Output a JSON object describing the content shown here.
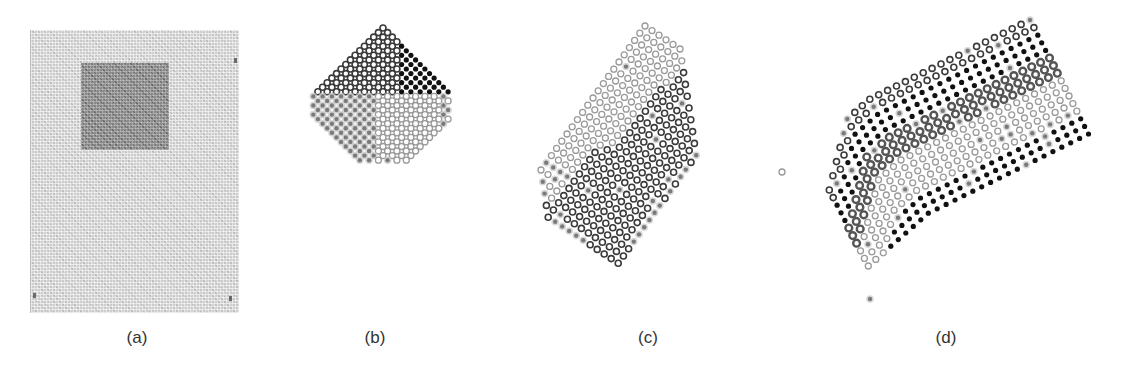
{
  "figure": {
    "panels": [
      {
        "id": "a",
        "caption": "(a)",
        "caption_x": 137,
        "description": "Scanned grey textured sheet with a darker square region in the upper portion"
      },
      {
        "id": "b",
        "caption": "(b)",
        "caption_x": 375,
        "description": "Diamond-shaped grid of sample points split into four clusters"
      },
      {
        "id": "c",
        "caption": "(c)",
        "caption_x": 648,
        "description": "Rotated rectangular grid of sample points split into two clusters with outlier dots on edges"
      },
      {
        "id": "d",
        "caption": "(d)",
        "caption_x": 946,
        "description": "Tilted folded-sheet grid of sample points in banded clusters"
      }
    ],
    "marker_styles": {
      "dark-ring": {
        "type": "ring",
        "color": "#3a3a3a",
        "r": 3.0,
        "stroke": 1.6
      },
      "light-ring": {
        "type": "ring",
        "color": "#9a9a9a",
        "r": 3.0,
        "stroke": 1.3
      },
      "black-dot": {
        "type": "dot",
        "color": "#111111",
        "r": 2.6
      },
      "gray-dot": {
        "type": "dot",
        "color": "#7a7a7a",
        "r": 2.2,
        "halo": "#c8c8c8"
      },
      "mid-ring": {
        "type": "ring",
        "color": "#555555",
        "r": 3.4,
        "stroke": 2.4
      }
    },
    "legend_colors": {
      "background": "#ffffff",
      "scan_light": "#cfcfcf",
      "scan_dark": "#8a8a8a",
      "caption_text": "#333333"
    }
  },
  "grids": {
    "b": {
      "origin": [
        383,
        28
      ],
      "u": [
        -6.6,
        6.6
      ],
      "v": [
        6.6,
        6.6
      ],
      "nu": 25,
      "nv": 25,
      "shape": "diamond",
      "regions": [
        {
          "label": "cluster-upper-left",
          "style": "dark-ring"
        },
        {
          "label": "cluster-upper-right",
          "style": "black-dot"
        },
        {
          "label": "cluster-right",
          "style": "light-ring"
        },
        {
          "label": "cluster-lower-left",
          "style": "gray-dot"
        }
      ]
    },
    "c": {
      "origin": [
        645,
        26
      ],
      "u": [
        -5.6,
        7.6
      ],
      "v": [
        7.4,
        5.0
      ],
      "nu": 24,
      "nv": 15,
      "regions": [
        {
          "label": "cluster-left",
          "style": "light-ring"
        },
        {
          "label": "cluster-right",
          "style": "dark-ring"
        },
        {
          "label": "edge-outliers",
          "style": "gray-dot"
        }
      ]
    },
    "d": {
      "origin": [
        1028,
        22
      ],
      "u": [
        -9.1,
        4.5
      ],
      "v": [
        4.2,
        7.8
      ],
      "nu": 26,
      "nv": 16,
      "regions": [
        {
          "label": "band-top-edge",
          "style": "dark-ring"
        },
        {
          "label": "band-black",
          "style": "black-dot"
        },
        {
          "label": "band-mid-ring",
          "style": "mid-ring"
        },
        {
          "label": "band-light",
          "style": "light-ring"
        },
        {
          "label": "band-bottom-black",
          "style": "black-dot"
        }
      ]
    }
  }
}
